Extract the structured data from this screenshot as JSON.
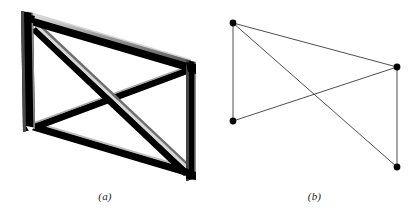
{
  "figure": {
    "background_color": "#ffffff",
    "width": 419,
    "height": 223,
    "beam_color": "#000000",
    "beam_highlight_color": "#9a9a9a",
    "beam_edge_color": "#c8c8c8",
    "schematic_line_color": "#3a3a3a",
    "node_color": "#000000"
  },
  "panels": [
    {
      "id": "a",
      "caption": "(a)",
      "description": "perspective rendering of cross-braced rectangular frame built from solid beams",
      "type": "solid-beam-frame",
      "members": [
        {
          "name": "left-post",
          "from": "top-left",
          "to": "bottom-left"
        },
        {
          "name": "right-post",
          "from": "top-right",
          "to": "bottom-right"
        },
        {
          "name": "top-chord",
          "from": "top-left",
          "to": "top-right"
        },
        {
          "name": "bottom-chord",
          "from": "bottom-left",
          "to": "bottom-right"
        },
        {
          "name": "diagonal-brace-1",
          "from": "top-left",
          "to": "bottom-right"
        },
        {
          "name": "diagonal-brace-2",
          "from": "bottom-left",
          "to": "top-right"
        }
      ],
      "joints": [
        {
          "name": "top-left",
          "x": 28,
          "y": 16
        },
        {
          "name": "bottom-left",
          "x": 30,
          "y": 128
        },
        {
          "name": "top-right",
          "x": 191,
          "y": 66
        },
        {
          "name": "bottom-right",
          "x": 192,
          "y": 176
        }
      ],
      "brace_crossing": {
        "x": 110,
        "y": 95
      }
    },
    {
      "id": "b",
      "caption": "(b)",
      "description": "idealized line diagram of the same frame with pin joints shown as filled dots",
      "type": "line-schematic",
      "nodes": [
        {
          "name": "node-top-left",
          "x": 23,
          "y": 23
        },
        {
          "name": "node-bottom-left",
          "x": 23,
          "y": 121
        },
        {
          "name": "node-top-right",
          "x": 187,
          "y": 67
        },
        {
          "name": "node-bottom-right",
          "x": 187,
          "y": 167
        }
      ],
      "node_radius": 3.4,
      "edges": [
        {
          "name": "edge-left-post",
          "from": "node-top-left",
          "to": "node-bottom-left"
        },
        {
          "name": "edge-right-post",
          "from": "node-top-right",
          "to": "node-bottom-right"
        },
        {
          "name": "edge-top-chord",
          "from": "node-top-left",
          "to": "node-top-right"
        },
        {
          "name": "edge-diagonal-1",
          "from": "node-top-left",
          "to": "node-bottom-right"
        },
        {
          "name": "edge-diagonal-2",
          "from": "node-bottom-left",
          "to": "node-top-right"
        }
      ]
    }
  ]
}
